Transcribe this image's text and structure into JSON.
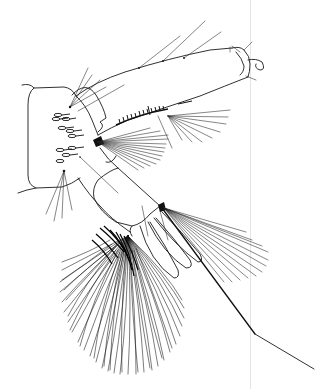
{
  "figure": {
    "type": "scientific line drawing",
    "background_color": "#ffffff",
    "line_color": "#1a1a1a",
    "page_edge_color": "#e4e4e4"
  },
  "parts": {
    "siphon": "siphon",
    "siphon_tip": "siphon-apex-valves",
    "segment8": "abdominal-segment-8",
    "comb_scales": "comb-scales",
    "pecten": "pecten",
    "anal_segment": "anal-segment",
    "anal_papillae": "anal-papillae",
    "ventral_brush": "ventral-brush",
    "caudal_seta": "long-caudal-seta",
    "dorsal_brush": "dorsal-brush"
  }
}
